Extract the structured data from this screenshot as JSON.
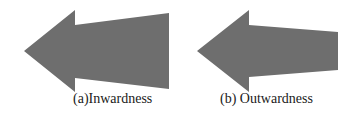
{
  "figure": {
    "arrow_color": "#6e6e6e",
    "panels": [
      {
        "id": "a",
        "caption": "(a)Inwardness",
        "direction": "left",
        "shaft": "widening toward tail",
        "points": "24,51 75,10 75,25 169,13 169,89 75,78 75,92"
      },
      {
        "id": "b",
        "caption": "(b) Outwardness",
        "direction": "left",
        "shaft": "narrowing toward tail",
        "points": "197,51 249,10 249,25 338,32 338,70 249,77 249,92"
      }
    ]
  }
}
